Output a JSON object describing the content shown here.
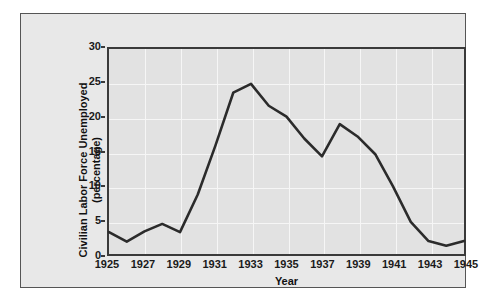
{
  "chart_data": {
    "type": "line",
    "title": "",
    "xlabel": "Year",
    "ylabel": "Civilian Labor Force Unemployed (percentage)",
    "ylabel_line1": "Civilian Labor Force Unemployed",
    "ylabel_line2": "(percentage)",
    "xlim": [
      1925,
      1945
    ],
    "ylim": [
      0,
      30
    ],
    "xticks": [
      1925,
      1927,
      1929,
      1931,
      1933,
      1935,
      1937,
      1939,
      1941,
      1943,
      1945
    ],
    "xtick_labels": [
      "1925",
      "1927",
      "1929",
      "1931",
      "1933",
      "1935",
      "1937",
      "1939",
      "1941",
      "1943",
      "1945"
    ],
    "yticks": [
      0,
      5,
      10,
      15,
      20,
      25,
      30
    ],
    "ytick_labels": [
      "0",
      "5",
      "10",
      "15",
      "20",
      "25",
      "30"
    ],
    "grid": true,
    "grid_color": "#f6f6f6",
    "legend": null,
    "line_color": "#2b2b2b",
    "line_width": 2.6,
    "plot_background": "#e2e2e2",
    "figure_background": "#e8e8e8",
    "x": [
      1925,
      1926,
      1927,
      1928,
      1929,
      1930,
      1931,
      1932,
      1933,
      1934,
      1935,
      1936,
      1937,
      1938,
      1939,
      1940,
      1941,
      1942,
      1943,
      1944,
      1945
    ],
    "values": [
      3.2,
      1.8,
      3.3,
      4.4,
      3.2,
      8.7,
      15.9,
      23.6,
      24.9,
      21.7,
      20.1,
      16.9,
      14.3,
      19.0,
      17.2,
      14.6,
      9.9,
      4.7,
      1.9,
      1.2,
      1.9
    ],
    "series": [
      {
        "name": "Civilian Labor Force Unemployed",
        "values": [
          3.2,
          1.8,
          3.3,
          4.4,
          3.2,
          8.7,
          15.9,
          23.6,
          24.9,
          21.7,
          20.1,
          16.9,
          14.3,
          19.0,
          17.2,
          14.6,
          9.9,
          4.7,
          1.9,
          1.2,
          1.9
        ]
      }
    ]
  }
}
